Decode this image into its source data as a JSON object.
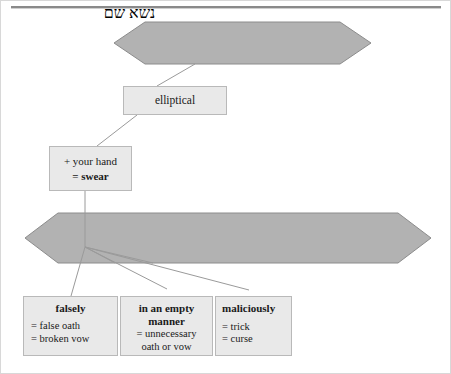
{
  "diagram": {
    "type": "semantic-tree",
    "title_rule": "horizontal-rule",
    "nodes": {
      "root_hexagon": {
        "label": "נשׂא שם",
        "transliteration_shape": "hexagon",
        "fill": "#b2b2b2"
      },
      "elliptical_box": {
        "label": "elliptical"
      },
      "swear_box": {
        "line1": "+ your hand",
        "line2": "= swear"
      },
      "second_hexagon": {
        "label": "לשוא",
        "fill": "#b2b2b2"
      },
      "leaves": [
        {
          "heading": "falsely",
          "glosses": [
            "= false oath",
            "= broken vow"
          ]
        },
        {
          "heading_line1": "in an empty",
          "heading_line2": "manner",
          "glosses": [
            "= unnecessary",
            "oath or vow"
          ]
        },
        {
          "heading": "maliciously",
          "glosses": [
            "= trick",
            "= curse"
          ]
        }
      ]
    },
    "colors": {
      "hexagon_fill": "#b2b2b2",
      "hexagon_stroke": "#8c8c8c",
      "box_fill": "#e9e9e9",
      "box_stroke": "#b9b9b9",
      "connector": "#9a9a9a",
      "rule": "#8a8a8a",
      "text": "#1a1a1a"
    }
  }
}
